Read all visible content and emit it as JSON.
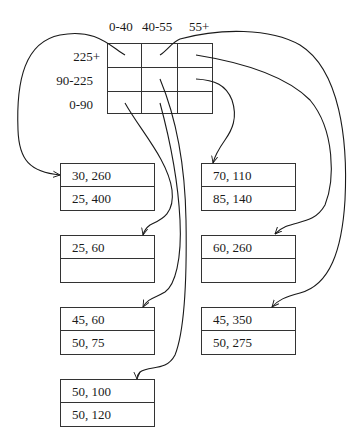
{
  "diagram": {
    "type": "grid-file-index",
    "column_headers": [
      "0-40",
      "40-55",
      "55+"
    ],
    "row_headers": [
      "225+",
      "90-225",
      "0-90"
    ],
    "buckets": [
      {
        "id": "L1",
        "records": [
          "30, 260",
          "25, 400"
        ]
      },
      {
        "id": "L2",
        "records": [
          "25, 60",
          ""
        ]
      },
      {
        "id": "L3",
        "records": [
          "45, 60",
          "50, 75"
        ]
      },
      {
        "id": "L4",
        "records": [
          "50, 100",
          "50, 120"
        ]
      },
      {
        "id": "R1",
        "records": [
          "70, 110",
          "85, 140"
        ]
      },
      {
        "id": "R2",
        "records": [
          "60, 260",
          ""
        ]
      },
      {
        "id": "R3",
        "records": [
          "45, 350",
          "50, 275"
        ]
      }
    ],
    "pointers": [
      {
        "from_cell": [
          "225+",
          "0-40"
        ],
        "to_bucket": "L1"
      },
      {
        "from_cell": [
          "225+",
          "40-55"
        ],
        "to_bucket": "R3"
      },
      {
        "from_cell": [
          "225+",
          "55+"
        ],
        "to_bucket": "R2"
      },
      {
        "from_cell": [
          "90-225",
          "55+"
        ],
        "to_bucket": "R1"
      },
      {
        "from_cell": [
          "0-90",
          "0-40"
        ],
        "to_bucket": "L2"
      },
      {
        "from_cell": [
          "0-90",
          "40-55"
        ],
        "to_bucket": "L3"
      },
      {
        "from_cell": [
          "90-225",
          "40-55"
        ],
        "to_bucket": "L4"
      }
    ],
    "line_color": "#1a1a1a"
  }
}
